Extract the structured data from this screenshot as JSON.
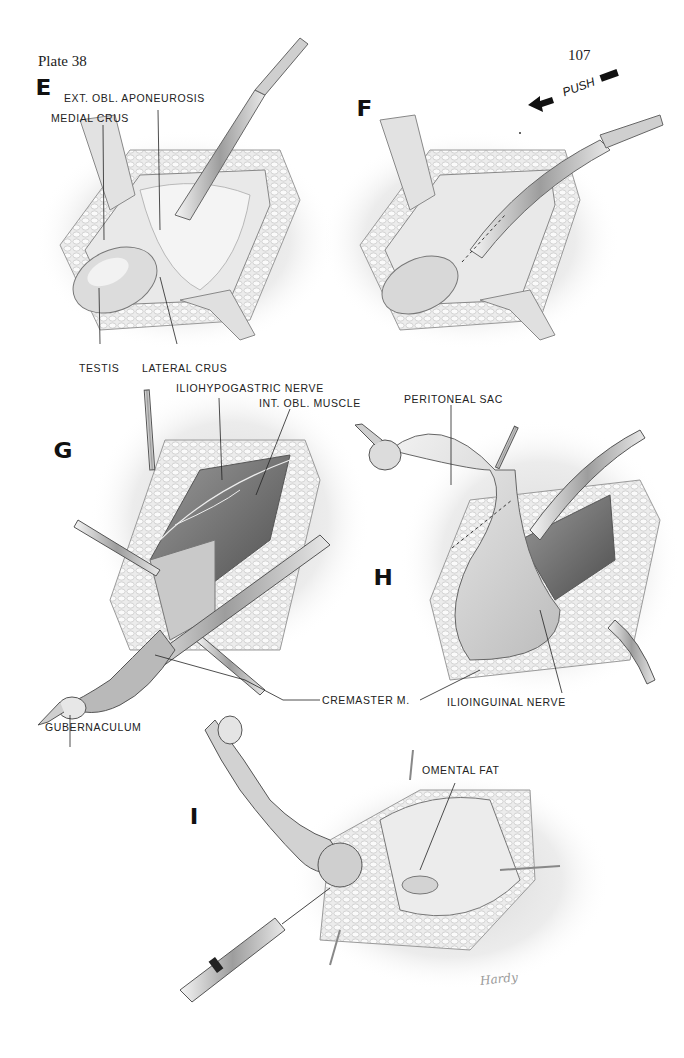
{
  "header": {
    "plate_title": "Plate 38",
    "page_number": "107"
  },
  "panels": {
    "E": {
      "letter": "E",
      "labels": {
        "ext_obl_aponeurosis": "EXT. OBL. APONEUROSIS",
        "medial_crus": "MEDIAL CRUS",
        "testis": "TESTIS",
        "lateral_crus": "LATERAL CRUS"
      }
    },
    "F": {
      "letter": "F",
      "annotation": "PUSH"
    },
    "G": {
      "letter": "G",
      "labels": {
        "iliohypogastric_nerve": "ILIOHYPOGASTRIC NERVE",
        "int_obl_muscle": "INT. OBL. MUSCLE",
        "gubernaculum": "GUBERNACULUM"
      }
    },
    "H": {
      "letter": "H",
      "labels": {
        "peritoneal_sac": "PERITONEAL SAC",
        "ilioinguinal_nerve": "ILIOINGUINAL NERVE"
      }
    },
    "shared": {
      "cremaster_m": "CREMASTER M."
    },
    "I": {
      "letter": "I",
      "labels": {
        "omental_fat": "OMENTAL FAT"
      }
    }
  },
  "signature": "Hardy",
  "colors": {
    "ink": "#1a1a1a",
    "tissue_light": "#e4e4e4",
    "tissue_mid": "#bdbdbd",
    "tissue_dark": "#6e6e6e",
    "background": "#ffffff"
  }
}
